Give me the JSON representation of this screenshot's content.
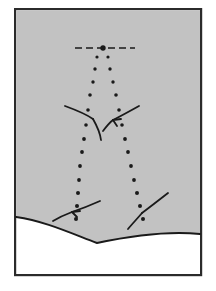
{
  "figure": {
    "domain_note": "technical line diagram",
    "canvas": {
      "width": 216,
      "height": 291
    },
    "colors": {
      "page_background": "#ffffff",
      "frame_stroke": "#2b2b2b",
      "field_fill": "#c2c2c2",
      "lower_fill": "#ffffff",
      "ink": "#1a1a1a"
    },
    "frame": {
      "x": 14,
      "y": 8,
      "width": 188,
      "height": 268,
      "stroke_width": 2.2,
      "label": "figure-border"
    },
    "field_region": {
      "label": "upper-gray-field",
      "description": "gray shaded upper domain bounded below by a downward-dipping interface curve"
    },
    "interface_curve": {
      "label": "lower-boundary-interface",
      "stroke_width": 1.9,
      "left_edge_y": 217,
      "trough_x": 97,
      "trough_y": 243,
      "right_edge_y": 234
    },
    "dash_line_top": {
      "label": "horizontal-dashed-axis",
      "y": 48,
      "x_start": 75,
      "x_end": 135,
      "dash_pattern": "7 4",
      "stroke_width": 1.7
    },
    "apex_marker": {
      "label": "apex-node",
      "x": 103,
      "y": 48,
      "radius": 2.6
    },
    "dot_trails": [
      {
        "name": "left-trajectory",
        "radius_top": 1.6,
        "radius_bottom": 1.9,
        "points": [
          [
            97,
            57
          ],
          [
            95,
            69
          ],
          [
            93,
            82
          ],
          [
            90,
            95
          ],
          [
            88,
            110
          ],
          [
            86,
            125
          ],
          [
            84,
            139
          ],
          [
            82,
            152
          ],
          [
            80,
            166
          ],
          [
            79,
            180
          ],
          [
            78,
            193
          ],
          [
            77,
            206
          ],
          [
            76,
            219
          ]
        ]
      },
      {
        "name": "right-trajectory",
        "radius_top": 1.6,
        "radius_bottom": 1.9,
        "points": [
          [
            108,
            57
          ],
          [
            110,
            69
          ],
          [
            113,
            82
          ],
          [
            116,
            95
          ],
          [
            119,
            110
          ],
          [
            122,
            125
          ],
          [
            125,
            139
          ],
          [
            128,
            152
          ],
          [
            131,
            166
          ],
          [
            134,
            180
          ],
          [
            137,
            193
          ],
          [
            140,
            206
          ],
          [
            143,
            219
          ]
        ]
      }
    ],
    "arrow_strokes": [
      {
        "name": "upper-left-arrow",
        "x1": 65,
        "y1": 106,
        "x2": 92,
        "y2": 118,
        "head": "end"
      },
      {
        "name": "upper-left-curve",
        "x1": 92,
        "y1": 118,
        "x2": 100,
        "y2": 138,
        "head": "none"
      },
      {
        "name": "upper-right-arrow",
        "x1": 138,
        "y1": 107,
        "x2": 113,
        "y2": 120,
        "head": "end"
      },
      {
        "name": "upper-right-tail",
        "x1": 113,
        "y1": 120,
        "x2": 104,
        "y2": 130,
        "head": "none"
      },
      {
        "name": "lower-left-arrow",
        "x1": 98,
        "y1": 202,
        "x2": 70,
        "y2": 213,
        "head": "end"
      },
      {
        "name": "lower-left-tail",
        "x1": 70,
        "y1": 213,
        "x2": 53,
        "y2": 221,
        "head": "none"
      },
      {
        "name": "lower-right-arrow",
        "x1": 167,
        "y1": 194,
        "x2": 142,
        "y2": 212,
        "head": "none"
      },
      {
        "name": "lower-right-tail",
        "x1": 142,
        "y1": 212,
        "x2": 128,
        "y2": 228,
        "head": "none"
      }
    ]
  }
}
